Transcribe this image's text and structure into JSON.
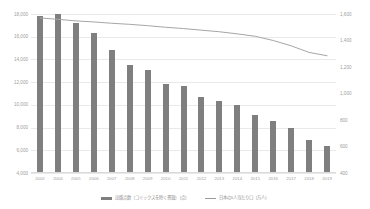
{
  "chart_data": {
    "type": "bar",
    "title": "",
    "subtitle": "",
    "xlabel": "",
    "ylabel": "",
    "y2label": "",
    "grid": true,
    "legend_position": "bottom",
    "categories": [
      "2002",
      "2004",
      "2005",
      "2006",
      "2007",
      "2008",
      "2009",
      "2010",
      "2011",
      "2012",
      "2013",
      "2014",
      "2015",
      "2016",
      "2017",
      "2018",
      "2019"
    ],
    "x": [
      "2002",
      "2004",
      "2005",
      "2006",
      "2007",
      "2008",
      "2009",
      "2010",
      "2011",
      "2012",
      "2013",
      "2014",
      "2015",
      "2016",
      "2017",
      "2018",
      "2019"
    ],
    "ylim": [
      4000,
      18000
    ],
    "yticks": [
      "4,000",
      "6,000",
      "8,000",
      "10,000",
      "12,000",
      "14,000",
      "16,000",
      "18,000"
    ],
    "ytick_values": [
      4000,
      6000,
      8000,
      10000,
      12000,
      14000,
      16000,
      18000
    ],
    "y2lim": [
      400,
      1600
    ],
    "y2ticks": [
      "400",
      "600",
      "800",
      "1,000",
      "1,200",
      "1,400",
      "1,600"
    ],
    "y2tick_values": [
      400,
      600,
      800,
      1000,
      1200,
      1400,
      1600
    ],
    "series": [
      {
        "name": "出版点数（コミックスを除く書籍）（点）",
        "type": "bar",
        "axis": "left",
        "color": "#7f7f7f",
        "values": [
          17800,
          18000,
          17200,
          16300,
          14800,
          13500,
          13100,
          11800,
          11700,
          10700,
          10300,
          10000,
          9100,
          8600,
          8000,
          6900,
          6400
        ]
      },
      {
        "name": "日本の人口あたり（万人）",
        "type": "line",
        "axis": "right",
        "color": "#a6a6a6",
        "values": [
          1570,
          1560,
          1548,
          1540,
          1530,
          1522,
          1512,
          1500,
          1490,
          1478,
          1466,
          1450,
          1432,
          1400,
          1360,
          1310,
          1285
        ]
      }
    ]
  },
  "legend": {
    "items": [
      {
        "marker": "bar-swatch",
        "label": "出版点数（コミックスを除く書籍）（点）"
      },
      {
        "marker": "line-swatch",
        "label": "日本の1人当たり口（万人）"
      }
    ]
  },
  "colors": {
    "bar": "#7f7f7f",
    "line": "#a6a6a6",
    "grid": "#e9e9e9",
    "text": "#9d9d9d",
    "background": "#ffffff"
  }
}
